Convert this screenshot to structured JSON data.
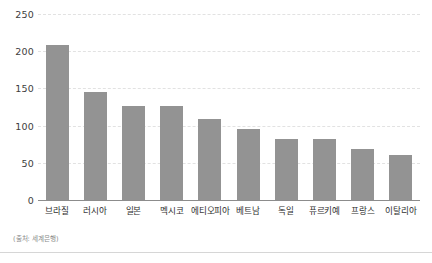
{
  "chart_data": {
    "type": "bar",
    "title": "",
    "subtitle": "",
    "xlabel": "",
    "ylabel": "",
    "ylim": [
      0,
      250
    ],
    "yticks": [
      0,
      50,
      100,
      150,
      200,
      250
    ],
    "grid": true,
    "legend": null,
    "legend_position": "none",
    "bar_color": "#939393",
    "grid_color": "#e2e2e2",
    "axis_color": "#8c8c8c",
    "categories": [
      "브라질",
      "러시아",
      "일본",
      "멕시코",
      "에티오피아",
      "베트남",
      "독일",
      "퓨르키예",
      "프랑스",
      "이탈리아"
    ],
    "values": [
      209,
      145,
      127,
      127,
      109,
      96,
      82,
      82,
      68,
      61
    ]
  },
  "source": {
    "note": "(출처: 세계은행)"
  }
}
